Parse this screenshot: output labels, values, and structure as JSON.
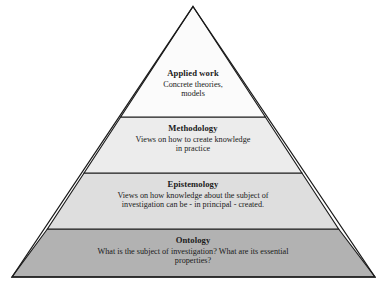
{
  "figure": {
    "type": "pyramid-diagram",
    "name": "research-philosophy-pyramid",
    "background_color": "#ffffff",
    "outline_color": "#1a1a1a"
  },
  "tiers": [
    {
      "id": "applied-work",
      "title": "Applied work",
      "description": "Concrete theories,\nmodels",
      "description_lines": [
        "Concrete theories,",
        "models"
      ],
      "fill": "#fbfbfb",
      "level": 1
    },
    {
      "id": "methodology",
      "title": "Methodology",
      "description": "Views on how to create knowledge\nin practice",
      "description_lines": [
        "Views on how to create knowledge",
        "in practice"
      ],
      "fill": "#ececec",
      "level": 2
    },
    {
      "id": "epistemology",
      "title": "Epistemology",
      "description": "Views on how knowledge about the subject of\ninvestigation can be - in principal - created.",
      "description_lines": [
        "Views on how knowledge about the subject of",
        "investigation can be - in principal - created."
      ],
      "fill": "#dedede",
      "level": 3
    },
    {
      "id": "ontology",
      "title": "Ontology",
      "description": "What is the subject of investigation? What are its essential\nproperties?",
      "description_lines": [
        "What is the subject of investigation? What are its essential",
        "properties?"
      ],
      "fill": "#b2b2b2",
      "level": 4
    }
  ],
  "geometry": {
    "apex_x": 193,
    "apex_y": 12,
    "base_left_x": 12,
    "base_right_x": 375,
    "base_y": 277,
    "divider_y": [
      117,
      173,
      229
    ]
  }
}
